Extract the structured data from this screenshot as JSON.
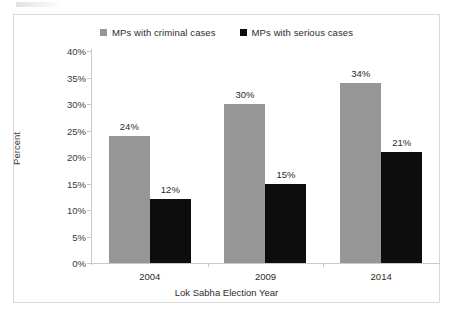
{
  "chart_data": {
    "type": "bar",
    "title": "",
    "xlabel": "Lok Sabha Election Year",
    "ylabel": "Percent",
    "categories": [
      "2004",
      "2009",
      "2014"
    ],
    "series": [
      {
        "name": "MPs with criminal cases",
        "color": "#969696",
        "values": [
          24,
          30,
          34
        ],
        "labels": [
          "24%",
          "30%",
          "34%"
        ]
      },
      {
        "name": "MPs with serious cases",
        "color": "#0d0d0d",
        "values": [
          12,
          15,
          21
        ],
        "labels": [
          "12%",
          "15%",
          "21%"
        ]
      }
    ],
    "ylim": [
      0,
      40
    ],
    "ytick_values": [
      0,
      5,
      10,
      15,
      20,
      25,
      30,
      35,
      40
    ],
    "ytick_labels": [
      "0%",
      "5%",
      "10%",
      "15%",
      "20%",
      "25%",
      "30%",
      "35%",
      "40%"
    ],
    "grid": false,
    "legend_position": "top-center",
    "value_labels_shown": true
  },
  "legend": {
    "entries": [
      {
        "label": "MPs with criminal cases",
        "color": "#969696"
      },
      {
        "label": "MPs with serious cases",
        "color": "#0d0d0d"
      }
    ]
  },
  "axes": {
    "y_title": "Percent",
    "x_title": "Lok Sabha Election Year"
  }
}
